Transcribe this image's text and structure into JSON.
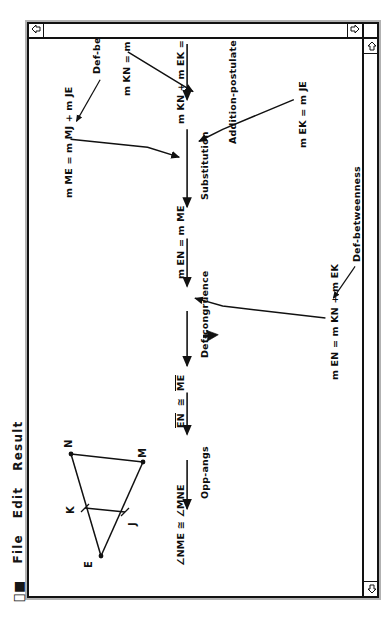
{
  "screen": {
    "menubar": {
      "apple_logo": "apple-logo",
      "items": [
        {
          "label": "File"
        },
        {
          "label": "Edit"
        },
        {
          "label": "Result"
        }
      ]
    },
    "window": {
      "scrollbars": {
        "vertical": {
          "up_arrow": "⇧",
          "down_arrow": "⇩"
        },
        "horizontal": {
          "left_arrow": "⇦",
          "right_arrow": "⇨"
        }
      }
    }
  },
  "figure": {
    "vertices": [
      {
        "name": "E",
        "x": 8,
        "y": 44
      },
      {
        "name": "K",
        "x": 58,
        "y": 24
      },
      {
        "name": "J",
        "x": 52,
        "y": 70
      },
      {
        "name": "N",
        "x": 112,
        "y": 14
      },
      {
        "name": "M",
        "x": 104,
        "y": 86
      }
    ],
    "vertex_labels": {
      "E": "E",
      "K": "K",
      "J": "J",
      "N": "N",
      "M": "M"
    }
  },
  "proof": {
    "type": "flowchart",
    "direction": "right-to-left",
    "nodes": [
      {
        "id": "n1",
        "text": "m EK = m JE",
        "row": "bottom",
        "col": 5
      },
      {
        "id": "n2",
        "text": "m KN = m MJ",
        "row": "bottom",
        "col": 4
      },
      {
        "id": "n3",
        "text": "m KN + m EK = m MJ + m JE",
        "row": "mid",
        "col": 4
      },
      {
        "id": "n4",
        "text": "m EN = m KN + m EK",
        "row": "top",
        "col": 3
      },
      {
        "id": "n5",
        "text": "m ME = m MJ + m JE",
        "row": "top",
        "col": 5
      },
      {
        "id": "n6",
        "text": "m EN = m ME",
        "row": "mid",
        "col": 3
      },
      {
        "id": "n7",
        "text": "EN ≅ ME",
        "row": "mid",
        "col": 2
      },
      {
        "id": "n8",
        "text": "∠NME ≅ ∠MNE",
        "row": "mid",
        "col": 1
      }
    ],
    "reasons": [
      {
        "id": "r1",
        "text": "Def-betweenness"
      },
      {
        "id": "r2",
        "text": "Def-betweenness"
      },
      {
        "id": "r3",
        "text": "Addition-postulate"
      },
      {
        "id": "r4",
        "text": "Substitution"
      },
      {
        "id": "r5",
        "text": "Def-congruence"
      },
      {
        "id": "r6",
        "text": "Opp-angs"
      }
    ],
    "segments": {
      "EK": "EK",
      "JE": "JE",
      "KN": "KN",
      "MJ": "MJ",
      "EN": "EN",
      "ME": "ME"
    }
  },
  "cursor": {
    "name": "arrow-pointer",
    "x": 254,
    "y": 174
  }
}
